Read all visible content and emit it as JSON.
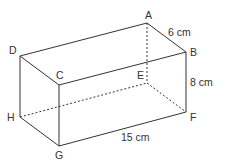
{
  "diagram": {
    "type": "cuboid",
    "vertices": {
      "A": [
        147,
        23
      ],
      "B": [
        186,
        52
      ],
      "C": [
        59,
        85
      ],
      "D": [
        20,
        56
      ],
      "E": [
        147,
        83
      ],
      "F": [
        186,
        112
      ],
      "G": [
        59,
        146
      ],
      "H": [
        20,
        117
      ]
    },
    "labels": {
      "A": "A",
      "B": "B",
      "C": "C",
      "D": "D",
      "E": "E",
      "F": "F",
      "G": "G",
      "H": "H"
    },
    "dimensions": {
      "width": "6 cm",
      "height": "8 cm",
      "length": "15 cm"
    },
    "colors": {
      "line": "#333333",
      "text": "#333333"
    }
  }
}
